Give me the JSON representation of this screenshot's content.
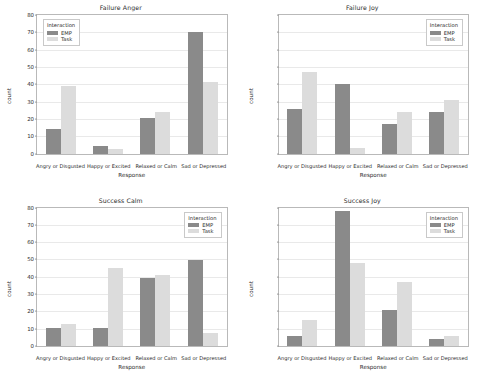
{
  "figure": {
    "legend_title": "Interaction",
    "series_names": [
      "EMP",
      "Task"
    ],
    "colors": {
      "emp": "#8a8a8a",
      "task": "#dcdcdc",
      "gridline": "#e9e9e9",
      "axis": "#b9b9b9",
      "background": "#ffffff"
    },
    "xlabel": "Response",
    "ylabel": "count",
    "categories": [
      "Angry or Disgusted",
      "Happy or Excited",
      "Relaxed or Calm",
      "Sad or Depressed"
    ],
    "yticks": [
      "0",
      "10",
      "20",
      "30",
      "40",
      "50",
      "60",
      "70",
      "80"
    ]
  },
  "chart_data": [
    {
      "type": "bar",
      "title": "Failure Anger",
      "xlabel": "Response",
      "ylabel": "count",
      "categories": [
        "Angry or Disgusted",
        "Happy or Excited",
        "Relaxed or Calm",
        "Sad or Depressed"
      ],
      "series": [
        {
          "name": "EMP",
          "values": [
            14,
            4.5,
            20.5,
            70
          ]
        },
        {
          "name": "Task",
          "values": [
            39,
            2.5,
            24,
            41.5
          ]
        }
      ],
      "ylim": [
        0,
        80
      ],
      "ytick_values": [
        0,
        10,
        20,
        30,
        40,
        50,
        60,
        70,
        80
      ],
      "ytick_labels_visible": true,
      "grid": true,
      "legend_position": "top-left"
    },
    {
      "type": "bar",
      "title": "Failure Joy",
      "xlabel": "Response",
      "ylabel": "count",
      "categories": [
        "Angry or Disgusted",
        "Happy or Excited",
        "Relaxed or Calm",
        "Sad or Depressed"
      ],
      "series": [
        {
          "name": "EMP",
          "values": [
            26,
            40,
            17,
            24
          ]
        },
        {
          "name": "Task",
          "values": [
            47,
            3,
            24,
            31
          ]
        }
      ],
      "ylim": [
        0,
        80
      ],
      "ytick_values": [
        0,
        10,
        20,
        30,
        40,
        50,
        60,
        70,
        80
      ],
      "ytick_labels_visible": false,
      "grid": true,
      "legend_position": "top-right"
    },
    {
      "type": "bar",
      "title": "Success Calm",
      "xlabel": "Response",
      "ylabel": "count",
      "categories": [
        "Angry or Disgusted",
        "Happy or Excited",
        "Relaxed or Calm",
        "Sad or Depressed"
      ],
      "series": [
        {
          "name": "EMP",
          "values": [
            10.5,
            10.5,
            39.5,
            49.5
          ]
        },
        {
          "name": "Task",
          "values": [
            13,
            45,
            41,
            7.5
          ]
        }
      ],
      "ylim": [
        0,
        80
      ],
      "ytick_values": [
        0,
        10,
        20,
        30,
        40,
        50,
        60,
        70,
        80
      ],
      "ytick_labels_visible": true,
      "grid": true,
      "legend_position": "top-right"
    },
    {
      "type": "bar",
      "title": "Success Joy",
      "xlabel": "Response",
      "ylabel": "count",
      "categories": [
        "Angry or Disgusted",
        "Happy or Excited",
        "Relaxed or Calm",
        "Sad or Depressed"
      ],
      "series": [
        {
          "name": "EMP",
          "values": [
            6,
            78,
            21,
            4
          ]
        },
        {
          "name": "Task",
          "values": [
            15,
            48,
            37,
            6
          ]
        }
      ],
      "ylim": [
        0,
        80
      ],
      "ytick_values": [
        0,
        10,
        20,
        30,
        40,
        50,
        60,
        70,
        80
      ],
      "ytick_labels_visible": false,
      "grid": true,
      "legend_position": "top-right"
    }
  ]
}
